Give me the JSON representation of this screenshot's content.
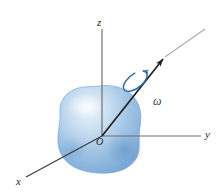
{
  "figure": {
    "kind": "3d-rotating-rigid-body-diagram",
    "background_color": "#ffffff"
  },
  "axes": {
    "z": {
      "label": "z",
      "color": "#231f20"
    },
    "y": {
      "label": "y",
      "color": "#231f20"
    },
    "x": {
      "label": "x",
      "color": "#231f20"
    },
    "origin": {
      "label": "O",
      "color": "#231f20"
    }
  },
  "rotation": {
    "axis_name": "rotation-axis-arrow",
    "axis_color": "#231f20",
    "axis_extension_color": "#a9a9a9",
    "angular_velocity_label": "ω",
    "angular_velocity_color": "#1f3f66",
    "spin_arrow_color": "#2d6ca8"
  },
  "body": {
    "name": "rigid-body-blob",
    "fill_color": "#8cb4dd",
    "edge_color": "#6fa0d0",
    "highlight_color": "#d6e7f5"
  }
}
